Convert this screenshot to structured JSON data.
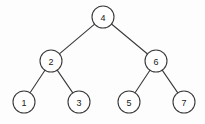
{
  "figure": {
    "background_color": "#fdfdfd",
    "line_color": "#3a3a3a",
    "node_fill_color": "#ffffff",
    "label_color": "#202020"
  },
  "chart_data": {
    "type": "diagram",
    "diagram_type": "binary-tree",
    "title": "",
    "node_radius": 11,
    "nodes": [
      {
        "id": "n4",
        "label": "4",
        "x": 103,
        "y": 17,
        "level": 0
      },
      {
        "id": "n2",
        "label": "2",
        "x": 51,
        "y": 61,
        "level": 1
      },
      {
        "id": "n6",
        "label": "6",
        "x": 156,
        "y": 61,
        "level": 1
      },
      {
        "id": "n1",
        "label": "1",
        "x": 24,
        "y": 102,
        "level": 2
      },
      {
        "id": "n3",
        "label": "3",
        "x": 79,
        "y": 102,
        "level": 2
      },
      {
        "id": "n5",
        "label": "5",
        "x": 129,
        "y": 102,
        "level": 2
      },
      {
        "id": "n7",
        "label": "7",
        "x": 184,
        "y": 102,
        "level": 2
      }
    ],
    "edges": [
      {
        "from": "n4",
        "to": "n2"
      },
      {
        "from": "n4",
        "to": "n6"
      },
      {
        "from": "n2",
        "to": "n1"
      },
      {
        "from": "n2",
        "to": "n3"
      },
      {
        "from": "n6",
        "to": "n5"
      },
      {
        "from": "n6",
        "to": "n7"
      }
    ]
  }
}
